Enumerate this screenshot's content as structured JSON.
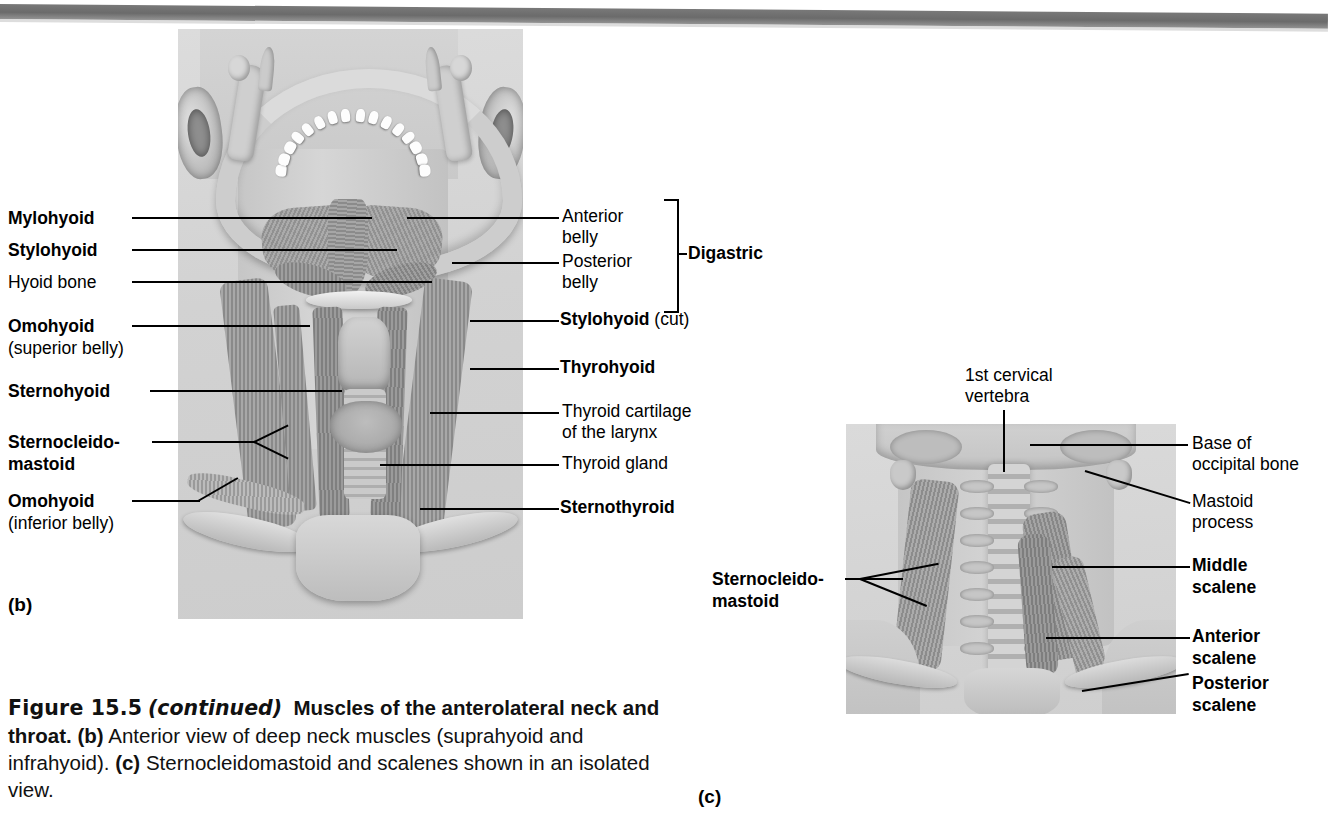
{
  "figure": {
    "number": "Figure 15.5",
    "continued": "(continued)",
    "title": "Muscles of the anterolateral neck and throat.",
    "caption_parts": {
      "b_marker": "(b)",
      "b_text": "Anterior view of deep neck muscles (suprahyoid and infrahyoid).",
      "c_marker": "(c)",
      "c_text": "Sternocleidomastoid and scalenes shown in an isolated view."
    },
    "full_caption": "Figure 15.5 (continued) Muscles of the anterolateral neck and throat. (b) Anterior view of deep neck muscles (suprahyoid and infrahyoid). (c) Sternocleidomastoid and scalenes shown in an isolated view."
  },
  "panels": {
    "b": {
      "marker": "(b)",
      "view": "Anterior view of deep neck muscles (suprahyoid and infrahyoid)"
    },
    "c": {
      "marker": "(c)",
      "view": "Sternocleidomastoid and scalenes shown in an isolated view"
    }
  },
  "panel_b_labels_left": [
    {
      "id": "mylohyoid",
      "text": "Mylohyoid",
      "style": "bold"
    },
    {
      "id": "stylohyoid",
      "text": "Stylohyoid",
      "style": "bold"
    },
    {
      "id": "hyoid-bone",
      "text": "Hyoid bone",
      "style": "regular"
    },
    {
      "id": "omohyoid-superior",
      "text": "Omohyoid",
      "sub": "(superior belly)",
      "style": "bold"
    },
    {
      "id": "sternohyoid",
      "text": "Sternohyoid",
      "style": "bold"
    },
    {
      "id": "sternocleidomastoid",
      "text": "Sternocleido-",
      "sub2": "mastoid",
      "style": "bold"
    },
    {
      "id": "omohyoid-inferior",
      "text": "Omohyoid",
      "sub": "(inferior belly)",
      "style": "bold"
    }
  ],
  "panel_b_labels_right": [
    {
      "id": "anterior-belly",
      "text": "Anterior",
      "line2": "belly",
      "style": "regular"
    },
    {
      "id": "posterior-belly",
      "text": "Posterior",
      "line2": "belly",
      "style": "regular"
    },
    {
      "id": "digastric-bracket",
      "text": "Digastric",
      "style": "bold"
    },
    {
      "id": "stylohyoid-cut",
      "text": "Stylohyoid",
      "suffix": " (cut)",
      "style": "bold-with-regular-suffix"
    },
    {
      "id": "thyrohyoid",
      "text": "Thyrohyoid",
      "style": "bold"
    },
    {
      "id": "thyroid-cartilage",
      "text": "Thyroid cartilage",
      "line2": "of the larynx",
      "style": "regular"
    },
    {
      "id": "thyroid-gland",
      "text": "Thyroid gland",
      "style": "regular"
    },
    {
      "id": "sternothyroid",
      "text": "Sternothyroid",
      "style": "bold"
    }
  ],
  "panel_c_labels": [
    {
      "id": "first-cervical-vertebra",
      "text": "1st cervical",
      "line2": "vertebra",
      "style": "regular",
      "position": "top"
    },
    {
      "id": "sternocleidomastoid-c",
      "text": "Sternocleido-",
      "line2": "mastoid",
      "style": "bold",
      "position": "left"
    },
    {
      "id": "base-of-occipital-bone",
      "text": "Base of",
      "line2": "occipital bone",
      "style": "regular",
      "position": "right"
    },
    {
      "id": "mastoid-process",
      "text": "Mastoid",
      "line2": "process",
      "style": "regular",
      "position": "right"
    },
    {
      "id": "middle-scalene",
      "text": "Middle",
      "line2": "scalene",
      "style": "bold",
      "position": "right"
    },
    {
      "id": "anterior-scalene",
      "text": "Anterior",
      "line2": "scalene",
      "style": "bold",
      "position": "right"
    },
    {
      "id": "posterior-scalene",
      "text": "Posterior",
      "line2": "scalene",
      "style": "bold",
      "position": "right"
    }
  ],
  "colors": {
    "ink": "#000000",
    "paper": "#ffffff",
    "illustration_bg": "#d4d4d4",
    "muscle": "#8e8e8e",
    "bone": "#d4d4d4",
    "scanbar": "#5e5e5e"
  }
}
